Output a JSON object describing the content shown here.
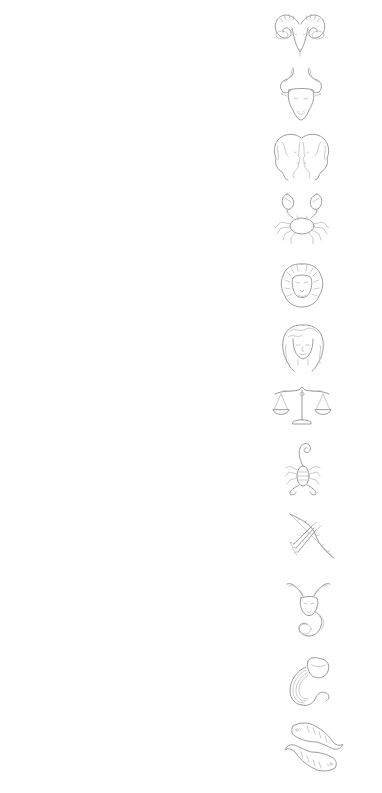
{
  "page": {
    "background": "#ffffff",
    "stroke_color": "#9c9c9c"
  },
  "zodiac": [
    {
      "sign": "Aries",
      "icon": "ram-head-icon",
      "x": 272,
      "y": 10,
      "w": 56,
      "h": 47
    },
    {
      "sign": "Taurus",
      "icon": "bull-head-icon",
      "x": 277,
      "y": 66,
      "w": 48,
      "h": 55
    },
    {
      "sign": "Gemini",
      "icon": "twin-faces-icon",
      "x": 270,
      "y": 132,
      "w": 63,
      "h": 49
    },
    {
      "sign": "Cancer",
      "icon": "crab-icon",
      "x": 273,
      "y": 190,
      "w": 58,
      "h": 55
    },
    {
      "sign": "Leo",
      "icon": "lion-head-icon",
      "x": 279,
      "y": 262,
      "w": 46,
      "h": 46
    },
    {
      "sign": "Virgo",
      "icon": "maiden-face-icon",
      "x": 280,
      "y": 323,
      "w": 46,
      "h": 49
    },
    {
      "sign": "Libra",
      "icon": "scales-icon",
      "x": 271,
      "y": 384,
      "w": 62,
      "h": 44
    },
    {
      "sign": "Scorpio",
      "icon": "scorpion-icon",
      "x": 284,
      "y": 440,
      "w": 38,
      "h": 57
    },
    {
      "sign": "Sagittarius",
      "icon": "bow-and-arrow-icon",
      "x": 284,
      "y": 510,
      "w": 52,
      "h": 51
    },
    {
      "sign": "Capricorn",
      "icon": "sea-goat-icon",
      "x": 285,
      "y": 578,
      "w": 47,
      "h": 60
    },
    {
      "sign": "Aquarius",
      "icon": "water-vessel-icon",
      "x": 288,
      "y": 655,
      "w": 44,
      "h": 53
    },
    {
      "sign": "Pisces",
      "icon": "two-fish-icon",
      "x": 283,
      "y": 720,
      "w": 62,
      "h": 55
    }
  ]
}
